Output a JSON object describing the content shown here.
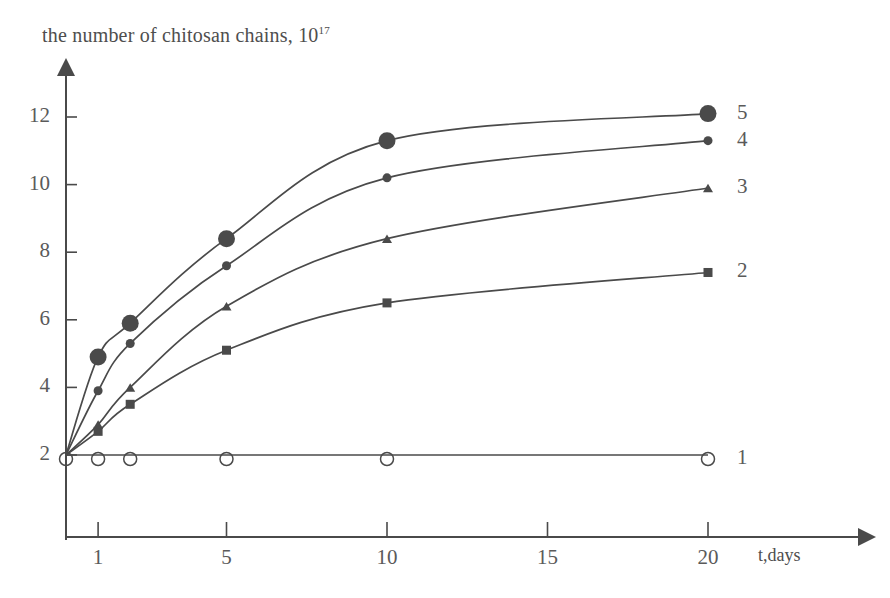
{
  "figure": {
    "title": "the number of chitosan chains, 10",
    "title_exponent": "17",
    "x_axis_name": "t,days",
    "background_color": "#ffffff",
    "ink_color": "#4a4a4a"
  },
  "chart_data": {
    "type": "line",
    "xlabel": "t,days",
    "ylabel": "the number of chitosan chains, 10^17",
    "xlim": [
      0,
      22.5
    ],
    "ylim": [
      1.5,
      13.0
    ],
    "grid": false,
    "legend_position": "right-of-curve-ends",
    "xticks": [
      1,
      5,
      10,
      15,
      20
    ],
    "xtick_labels": [
      "1",
      "5",
      "10",
      "15",
      "20"
    ],
    "yticks": [
      2,
      4,
      6,
      8,
      10,
      12
    ],
    "ytick_labels": [
      "2",
      "4",
      "6",
      "8",
      "10",
      "12"
    ],
    "x": [
      0,
      1,
      2,
      5,
      10,
      20
    ],
    "series": [
      {
        "name": "1",
        "label": "1",
        "marker": "open-circle",
        "marker_size": 13,
        "values": [
          2.0,
          2.0,
          2.0,
          2.0,
          2.0,
          2.0
        ]
      },
      {
        "name": "2",
        "label": "2",
        "marker": "filled-square",
        "marker_size": 9,
        "values": [
          2.0,
          2.7,
          3.5,
          5.1,
          6.5,
          7.4
        ]
      },
      {
        "name": "3",
        "label": "3",
        "marker": "filled-triangle",
        "marker_size": 10,
        "values": [
          2.0,
          2.9,
          4.0,
          6.4,
          8.4,
          9.9
        ]
      },
      {
        "name": "4",
        "label": "4",
        "marker": "small-filled-circle",
        "marker_size": 9,
        "values": [
          2.0,
          3.9,
          5.3,
          7.6,
          10.2,
          11.3
        ]
      },
      {
        "name": "5",
        "label": "5",
        "marker": "large-filled-circle",
        "marker_size": 17,
        "values": [
          2.0,
          4.9,
          5.9,
          8.4,
          11.3,
          12.1
        ]
      }
    ]
  },
  "labels": {
    "y_ticks": [
      "12",
      "10",
      "8",
      "6",
      "4",
      "2"
    ],
    "x_ticks": [
      "1",
      "5",
      "10",
      "15",
      "20"
    ],
    "curves": [
      "5",
      "4",
      "3",
      "2",
      "1"
    ]
  }
}
